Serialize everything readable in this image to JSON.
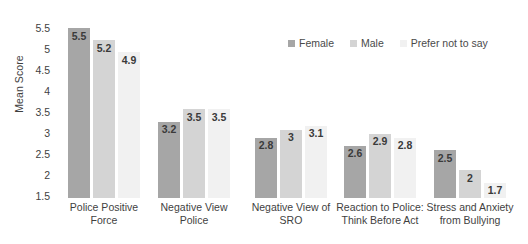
{
  "chart_data": {
    "type": "bar",
    "title": "",
    "xlabel": "",
    "ylabel": "Mean Score",
    "ylim": [
      1.5,
      5.75
    ],
    "yticks": [
      "5.5",
      "5",
      "4.5",
      "4",
      "3.5",
      "3",
      "2.5",
      "2",
      "1.5"
    ],
    "grid": false,
    "legend_position": "top-right",
    "categories": [
      "Police Positive Force",
      "Negative View Police",
      "Negative View of SRO",
      "Reaction to Police: Think Before Act",
      "Stress and Anxiety from Bullying"
    ],
    "category_lines": [
      [
        "Police Positive",
        "Force"
      ],
      [
        "Negative View",
        "Police"
      ],
      [
        "Negative View of",
        "SRO"
      ],
      [
        "Reaction to Police:",
        "Think Before Act"
      ],
      [
        "Stress and Anxiety",
        "from Bullying"
      ]
    ],
    "series": [
      {
        "name": "Female",
        "color": "#a6a6a6",
        "values": [
          5.5,
          3.2,
          2.8,
          2.6,
          2.5
        ],
        "labels": [
          "5.5",
          "3.2",
          "2.8",
          "2.6",
          "2.5"
        ]
      },
      {
        "name": "Male",
        "color": "#d4d4d4",
        "values": [
          5.2,
          3.5,
          3.0,
          2.9,
          2.0
        ],
        "labels": [
          "5.2",
          "3.5",
          "3",
          "2.9",
          "2"
        ]
      },
      {
        "name": "Prefer not to say",
        "color": "#f1f1f1",
        "values": [
          4.9,
          3.5,
          3.1,
          2.8,
          1.7
        ],
        "labels": [
          "4.9",
          "3.5",
          "3.1",
          "2.8",
          "1.7"
        ]
      }
    ]
  }
}
